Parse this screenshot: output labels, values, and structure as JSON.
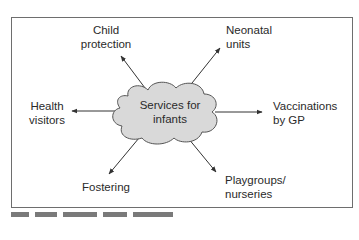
{
  "diagram": {
    "center": {
      "line1": "Services for",
      "line2": "infants"
    },
    "nodes": [
      {
        "id": "child-protection",
        "line1": "Child",
        "line2": "protection"
      },
      {
        "id": "neonatal-units",
        "line1": "Neonatal",
        "line2": "units"
      },
      {
        "id": "health-visitors",
        "line1": "Health",
        "line2": "visitors"
      },
      {
        "id": "vaccinations",
        "line1": "Vaccinations",
        "line2": "by GP"
      },
      {
        "id": "fostering",
        "line1": "Fostering",
        "line2": ""
      },
      {
        "id": "playgroups",
        "line1": "Playgroups/",
        "line2": "nurseries"
      }
    ]
  },
  "colors": {
    "cloud_fill": "#d9d9d9",
    "cloud_stroke": "#555555",
    "frame": "#6e6e6e",
    "arrow": "#333333"
  }
}
